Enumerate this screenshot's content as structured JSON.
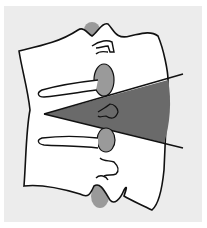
{
  "figure": {
    "colors": {
      "page_background": "#ffffff",
      "panel_background": "#ececec",
      "bone_fill": "#ffffff",
      "outline": "#111111",
      "disc_fill": "#9a9a9a",
      "wedge_fill": "#6a6a6a"
    },
    "labels": []
  }
}
